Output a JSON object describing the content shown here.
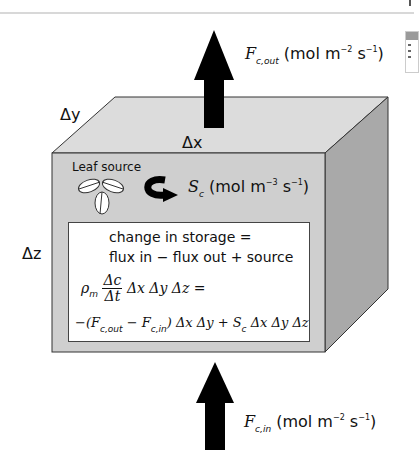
{
  "diagram": {
    "dimensions": {
      "dx": "Δx",
      "dy": "Δy",
      "dz": "Δz"
    },
    "flux_out": {
      "symbol": "F",
      "subscript": "c,out",
      "units_prefix": "(mol m",
      "units_exp1": "−2",
      "units_mid": " s",
      "units_exp2": "−1",
      "units_suffix": ")"
    },
    "flux_in": {
      "symbol": "F",
      "subscript": "c,in",
      "units_prefix": "(mol m",
      "units_exp1": "−2",
      "units_mid": " s",
      "units_exp2": "−1",
      "units_suffix": ")"
    },
    "source": {
      "leaf_label": "Leaf source",
      "symbol": "S",
      "subscript": "c",
      "units_prefix": "(mol m",
      "units_exp1": "−3",
      "units_mid": " s",
      "units_exp2": "−1",
      "units_suffix": ")"
    },
    "equation_box": {
      "line1": "change in storage =",
      "line2": "flux in − flux out + source",
      "rho": "ρ",
      "rho_sub": "m",
      "frac_num": "Δc",
      "frac_den": "Δt",
      "lhs_rest": " Δx Δy Δz =",
      "rhs_a": "−(F",
      "rhs_sub1": "c,out",
      "rhs_b": " − F",
      "rhs_sub2": "c,in",
      "rhs_c": ") Δx Δy + S",
      "rhs_sub3": "c",
      "rhs_d": " Δx Δy Δz"
    },
    "colors": {
      "front_face": "#cfcfcf",
      "top_face": "#dcdcdc",
      "side_face": "#a9a9a9",
      "arrow": "#000000",
      "edge": "#333333"
    }
  }
}
